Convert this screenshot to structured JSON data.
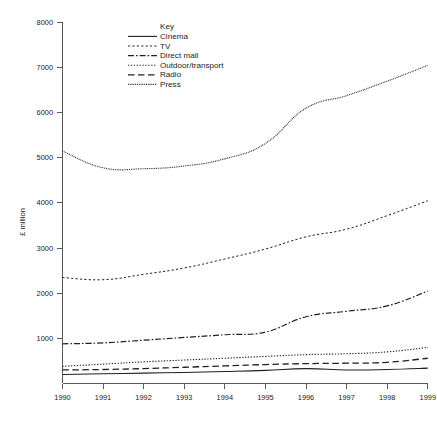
{
  "chart_data": {
    "type": "line",
    "title": "",
    "subtitle": "",
    "xlabel": "",
    "ylabel": "£ million",
    "x": [
      1990,
      1991,
      1992,
      1993,
      1994,
      1995,
      1996,
      1997,
      1998,
      1999
    ],
    "categories": [
      "1990",
      "1991",
      "1992",
      "1993",
      "1994",
      "1995",
      "1996",
      "1997",
      "1998",
      "1999"
    ],
    "xlim": [
      1990,
      1999
    ],
    "ylim": [
      0,
      8000
    ],
    "ytick_labels": [
      "1000",
      "2000",
      "3000",
      "4000",
      "5000",
      "6000",
      "7000",
      "8000"
    ],
    "ytick_values": [
      1000,
      2000,
      3000,
      4000,
      5000,
      6000,
      7000,
      8000
    ],
    "ytick_step": 1000,
    "grid": false,
    "legend_position": "top-left-inside",
    "legend_title": "Key",
    "series": [
      {
        "name": "Cinema",
        "style": "solid",
        "values": [
          200,
          215,
          230,
          245,
          265,
          290,
          330,
          300,
          310,
          340
        ]
      },
      {
        "name": "TV",
        "style": "dashed-gap",
        "values": [
          2350,
          2300,
          2420,
          2560,
          2760,
          2980,
          3250,
          3420,
          3720,
          4050
        ]
      },
      {
        "name": "Direct mail",
        "style": "dash-dot",
        "values": [
          880,
          900,
          960,
          1020,
          1080,
          1140,
          1480,
          1600,
          1720,
          2050
        ]
      },
      {
        "name": "Outdoor/transport",
        "style": "fine-dotted",
        "values": [
          380,
          430,
          480,
          520,
          560,
          600,
          640,
          660,
          700,
          800
        ]
      },
      {
        "name": "Radio",
        "style": "long-dash",
        "values": [
          300,
          310,
          330,
          360,
          390,
          420,
          440,
          450,
          470,
          560
        ]
      },
      {
        "name": "Press",
        "style": "tiny-dotted",
        "values": [
          5150,
          4780,
          4760,
          4820,
          4980,
          5320,
          6100,
          6380,
          6700,
          7050
        ]
      }
    ]
  },
  "axis": {
    "ylabel": "£ million"
  },
  "legend": {
    "title": "Key",
    "items": [
      {
        "label": "Cinema"
      },
      {
        "label": "TV"
      },
      {
        "label": "Direct mail"
      },
      {
        "label": "Outdoor/transport"
      },
      {
        "label": "Radio"
      },
      {
        "label": "Press"
      }
    ]
  },
  "colors": {
    "ink": "#202020",
    "axis": "#555a5e",
    "background": "#ffffff"
  }
}
